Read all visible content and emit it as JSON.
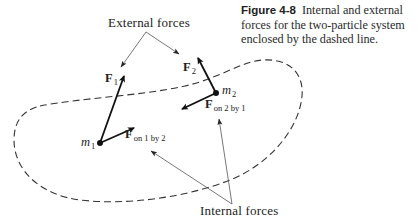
{
  "caption": {
    "figure_number": "Figure 4-8",
    "text": "Internal and external forces for the two-particle system enclosed by the dashed line."
  },
  "labels": {
    "external_forces": "External forces",
    "internal_forces": "Internal forces",
    "F1": {
      "symbol": "F",
      "subscript": "1"
    },
    "F2": {
      "symbol": "F",
      "subscript": "2"
    },
    "F_on_2_by_1": {
      "symbol": "F",
      "subscript": "on 2 by 1"
    },
    "F_on_1_by_2": {
      "symbol": "F",
      "subscript": "on 1 by 2"
    },
    "m1": {
      "symbol": "m",
      "subscript": "1"
    },
    "m2": {
      "symbol": "m",
      "subscript": "2"
    }
  },
  "colors": {
    "ink": "#1a1a1a",
    "pointer_line": "#555555",
    "background": "#ffffff"
  }
}
